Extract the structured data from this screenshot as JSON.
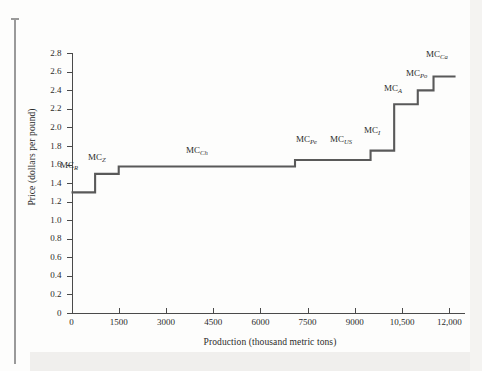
{
  "chart_data": {
    "type": "line",
    "subtype": "step",
    "title": "",
    "xlabel": "Production (thousand metric tons)",
    "ylabel": "Price (dollars per pound)",
    "xlim": [
      0,
      12500
    ],
    "ylim": [
      0,
      2.9
    ],
    "xticks": [
      0,
      1500,
      3000,
      4500,
      6000,
      7500,
      9000,
      10500,
      12000
    ],
    "xtick_labels": [
      "0",
      "1500",
      "3000",
      "4500",
      "6000",
      "7500",
      "9000",
      "10,500",
      "12,000"
    ],
    "yticks": [
      0,
      0.2,
      0.4,
      0.6,
      0.8,
      1.0,
      1.2,
      1.4,
      1.6,
      1.8,
      2.0,
      2.2,
      2.4,
      2.6,
      2.8
    ],
    "ytick_labels": [
      "0",
      "0.2",
      "0.4",
      "0.6",
      "0.8",
      "1.0",
      "1.2",
      "1.4",
      "1.6",
      "1.8",
      "2.0",
      "2.2",
      "2.4",
      "2.6",
      "2.8"
    ],
    "grid": false,
    "legend": "none",
    "series_color": "#595959",
    "steps": [
      {
        "label": "MC",
        "sub": "R",
        "x_start": 0,
        "x_end": 750,
        "price": 1.3
      },
      {
        "label": "MC",
        "sub": "Z",
        "x_start": 750,
        "x_end": 1500,
        "price": 1.5
      },
      {
        "label": "MC",
        "sub": "Ch",
        "x_start": 1500,
        "x_end": 7100,
        "price": 1.58
      },
      {
        "label": "MC",
        "sub": "Pe",
        "x_start": 7100,
        "x_end": 9300,
        "price": 1.65
      },
      {
        "label": "MC",
        "sub": "US",
        "x_start": 9300,
        "x_end": 9500,
        "price": 1.65
      },
      {
        "label": "MC",
        "sub": "I",
        "x_start": 9500,
        "x_end": 10250,
        "price": 1.75
      },
      {
        "label": "MC",
        "sub": "A",
        "x_start": 10250,
        "x_end": 11000,
        "price": 2.25
      },
      {
        "label": "MC",
        "sub": "Po",
        "x_start": 11000,
        "x_end": 11500,
        "price": 2.4
      },
      {
        "label": "MC",
        "sub": "Ca",
        "x_start": 11500,
        "x_end": 12200,
        "price": 2.55
      }
    ],
    "step_labels": [
      {
        "text": "MC",
        "sub": "R",
        "x_px": 60,
        "y_px": 161
      },
      {
        "text": "MC",
        "sub": "Z",
        "x_px": 88,
        "y_px": 153
      },
      {
        "text": "MC",
        "sub": "Ch",
        "x_px": 186,
        "y_px": 146
      },
      {
        "text": "MC",
        "sub": "Pe",
        "x_px": 296,
        "y_px": 135
      },
      {
        "text": "MC",
        "sub": "US",
        "x_px": 330,
        "y_px": 135
      },
      {
        "text": "MC",
        "sub": "I",
        "x_px": 364,
        "y_px": 126
      },
      {
        "text": "MC",
        "sub": "A",
        "x_px": 384,
        "y_px": 84
      },
      {
        "text": "MC",
        "sub": "Po",
        "x_px": 406,
        "y_px": 69
      },
      {
        "text": "MC",
        "sub": "Ca",
        "x_px": 426,
        "y_px": 50
      }
    ]
  }
}
